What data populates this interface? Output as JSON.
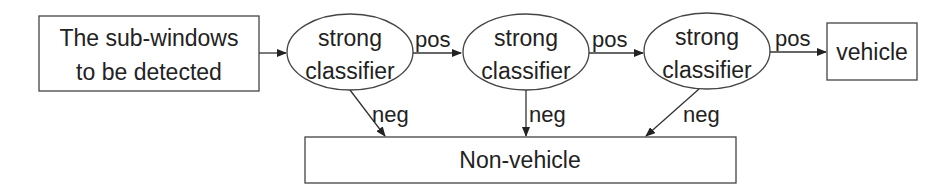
{
  "diagram": {
    "input_box": {
      "line1": "The sub-windows",
      "line2": "to be detected"
    },
    "classifiers": [
      {
        "line1": "strong",
        "line2": "classifier"
      },
      {
        "line1": "strong",
        "line2": "classifier"
      },
      {
        "line1": "strong",
        "line2": "classifier"
      }
    ],
    "pos_labels": [
      "pos",
      "pos",
      "pos"
    ],
    "neg_labels": [
      "neg",
      "neg",
      "neg"
    ],
    "output_positive": "vehicle",
    "output_negative": "Non-vehicle",
    "colors": {
      "stroke": "#333333",
      "text": "#222222",
      "background": "#ffffff"
    }
  }
}
